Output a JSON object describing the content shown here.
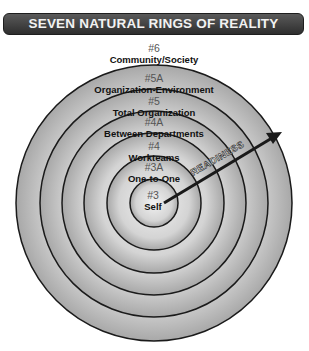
{
  "title": "SEVEN NATURAL RINGS OF REALITY",
  "rings": [
    {
      "number": "#6",
      "label": "Community/Society"
    },
    {
      "number": "#5A",
      "label": "Organization-Environment"
    },
    {
      "number": "#5",
      "label": "Total Organization"
    },
    {
      "number": "#4A",
      "label": "Between Departments"
    },
    {
      "number": "#4",
      "label": "Workteams"
    },
    {
      "number": "#3A",
      "label": "One-to-One"
    },
    {
      "number": "#3",
      "label": "Self"
    }
  ],
  "arrow": {
    "label": "READINESS"
  },
  "colors": {
    "title_bg": "#3a3a3a",
    "title_text": "#f2f2f2",
    "ring_fill": "#c8c8c8",
    "ring_stroke": "#1a1a1a"
  }
}
